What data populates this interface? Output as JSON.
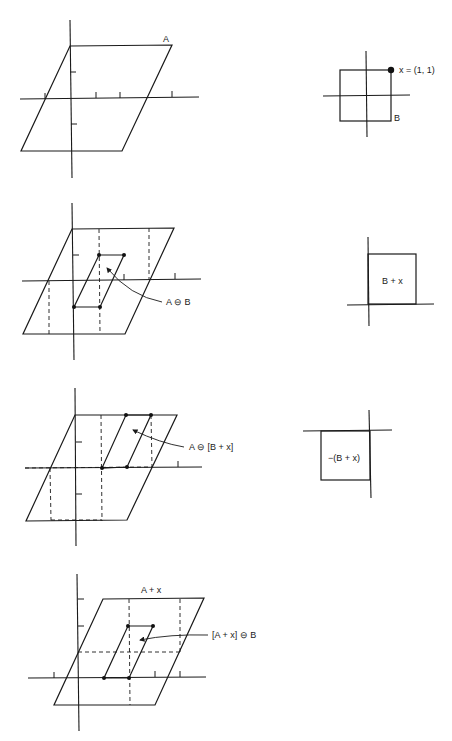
{
  "figure": {
    "panels": [
      {
        "id": "p1-left",
        "label": "A"
      },
      {
        "id": "p1-right",
        "label_point": "x = (1, 1)",
        "label_set": "B"
      },
      {
        "id": "p2-left",
        "label": "A ⊖ B"
      },
      {
        "id": "p2-right",
        "label": "B + x"
      },
      {
        "id": "p3-left",
        "label": "A ⊖ [B + x]"
      },
      {
        "id": "p3-right",
        "label": "−(B + x)"
      },
      {
        "id": "p4-left",
        "label_top": "A + x",
        "label_side": "[A + x] ⊖ B"
      }
    ]
  },
  "colors": {
    "ink": "#1a1a1a",
    "background": "#ffffff"
  }
}
